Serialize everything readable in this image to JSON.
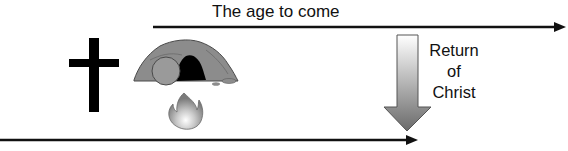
{
  "diagram": {
    "top_timeline": {
      "label": "The age to come"
    },
    "return_arrow": {
      "label_lines": [
        "Return",
        "of",
        "Christ"
      ]
    },
    "icons": [
      "cross-icon",
      "empty-tomb-icon",
      "fire-icon",
      "down-arrow-icon"
    ],
    "colors": {
      "line": "#111111",
      "tomb_rock": "#8a8a8a",
      "tomb_opening": "#000000",
      "arrow_gradient_top": "#ffffff",
      "arrow_gradient_bottom": "#6e6e6e"
    }
  }
}
